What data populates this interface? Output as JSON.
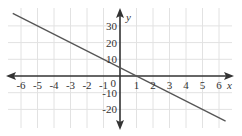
{
  "chart_data": {
    "type": "line",
    "title": "",
    "xlabel": "x",
    "ylabel": "y",
    "xlim": [
      -6.5,
      6.5
    ],
    "ylim": [
      -28,
      38
    ],
    "grid": true,
    "x_ticks": [
      -6,
      -5,
      -4,
      -3,
      -2,
      -1,
      0,
      1,
      2,
      3,
      4,
      5,
      6
    ],
    "x_tick_labels": [
      "-6",
      "-5",
      "-4",
      "-3",
      "-2",
      "-1",
      "0",
      "1",
      "2",
      "3",
      "4",
      "5",
      "6"
    ],
    "y_ticks": [
      -20,
      -10,
      10,
      20,
      30
    ],
    "y_tick_labels": [
      "-20",
      "-10",
      "10",
      "20",
      "30"
    ],
    "series": [
      {
        "name": "line",
        "equation": "y = -5x + 5",
        "x": [
          -6.5,
          6.4
        ],
        "y": [
          37.5,
          -27
        ]
      }
    ],
    "colors": {
      "line": "#555555",
      "axis": "#333333",
      "grid": "#e2e2e2"
    }
  }
}
